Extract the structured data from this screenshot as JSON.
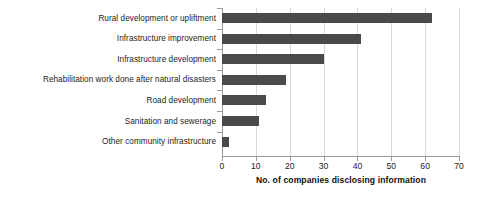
{
  "chart_data": {
    "type": "bar",
    "orientation": "horizontal",
    "title": "",
    "xlabel": "No. of companies disclosing information",
    "ylabel": "",
    "xlim": [
      0,
      70
    ],
    "xticks": [
      0,
      10,
      20,
      30,
      40,
      50,
      60,
      70
    ],
    "grid": "vertical",
    "legend": "none",
    "bar_color": "#4a4a4a",
    "categories": [
      "Rural development or upliftment",
      "Infrastructure improvement",
      "Infrastructure development",
      "Rehabilitation work done after natural disasters",
      "Road development",
      "Sanitation and sewerage",
      "Other community infrastructure"
    ],
    "values": [
      62,
      41,
      30,
      19,
      13,
      11,
      2
    ]
  }
}
